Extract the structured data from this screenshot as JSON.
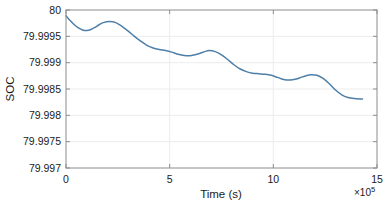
{
  "chart_data": {
    "type": "line",
    "title": "",
    "xlabel": "Time (s)",
    "ylabel": "SOC",
    "x_exponent_label": "×10",
    "x_exponent_value": "5",
    "x_multiplier": 100000,
    "xlim": [
      0,
      15
    ],
    "ylim": [
      79.997,
      80
    ],
    "xticks": [
      0,
      5,
      10,
      15
    ],
    "xticklabels": [
      "0",
      "5",
      "10",
      "15"
    ],
    "yticks": [
      79.997,
      79.9975,
      79.998,
      79.9985,
      79.999,
      79.9995,
      80
    ],
    "yticklabels": [
      "79.997",
      "79.9975",
      "79.998",
      "79.9985",
      "79.999",
      "79.9995",
      "80"
    ],
    "grid": true,
    "legend": null,
    "series": [
      {
        "name": "SOC",
        "color": "#4d7fa8",
        "linewidth": 1.5,
        "x": [
          0.0,
          0.2,
          0.4,
          0.6,
          0.8,
          1.0,
          1.2,
          1.4,
          1.6,
          1.8,
          2.1,
          2.4,
          2.7,
          3.0,
          3.3,
          3.6,
          3.9,
          4.2,
          4.5,
          4.8,
          5.1,
          5.4,
          5.8,
          6.1,
          6.4,
          6.7,
          6.9,
          7.2,
          7.5,
          7.8,
          8.1,
          8.4,
          8.7,
          9.0,
          9.3,
          9.6,
          9.9,
          10.2,
          10.5,
          10.8,
          11.1,
          11.4,
          11.8,
          12.1,
          12.4,
          12.7,
          13.0,
          13.3,
          13.6,
          13.9,
          14.3
        ],
        "y": [
          79.99989,
          79.9998,
          79.99972,
          79.99966,
          79.99962,
          79.99961,
          79.99963,
          79.99967,
          79.99972,
          79.99976,
          79.99978,
          79.99976,
          79.99969,
          79.9996,
          79.9995,
          79.99941,
          79.99933,
          79.99928,
          79.99925,
          79.99923,
          79.9992,
          79.99916,
          79.99913,
          79.99914,
          79.99917,
          79.99921,
          79.99923,
          79.99921,
          79.99915,
          79.99906,
          79.99896,
          79.99888,
          79.99883,
          79.9988,
          79.99879,
          79.99878,
          79.99876,
          79.99872,
          79.99868,
          79.99867,
          79.99869,
          79.99873,
          79.99877,
          79.99876,
          79.9987,
          79.9986,
          79.99848,
          79.99839,
          79.99834,
          79.99832,
          79.99831
        ]
      }
    ]
  },
  "axes": {
    "box_color": "#8c8c8c",
    "grid_color": "#ececec",
    "background": "#ffffff"
  }
}
